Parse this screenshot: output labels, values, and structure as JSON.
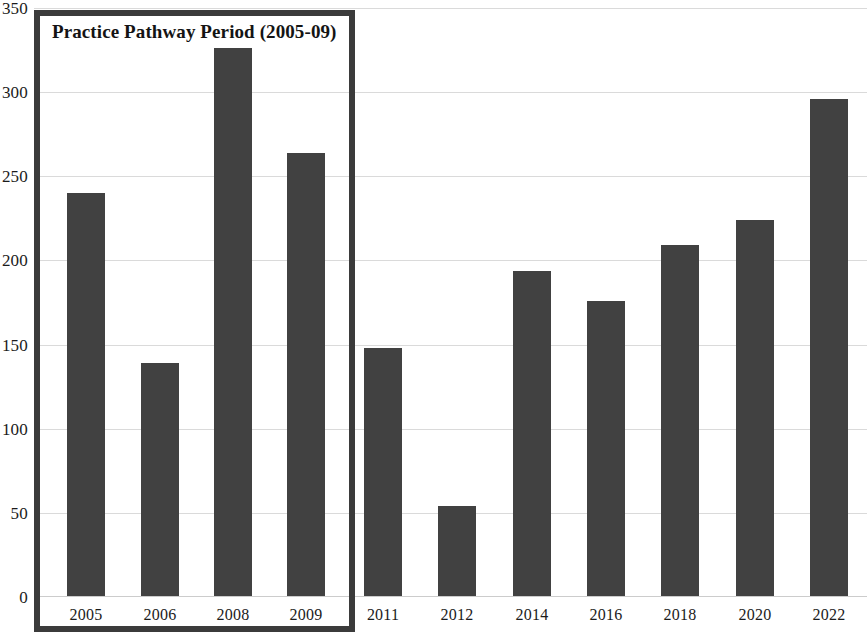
{
  "chart_data": {
    "type": "bar",
    "title": "",
    "xlabel": "",
    "ylabel": "",
    "ylim": [
      0,
      350
    ],
    "ytick_step": 50,
    "yticks": [
      350,
      300,
      250,
      200,
      150,
      100,
      50,
      0
    ],
    "grid": true,
    "legend": "none",
    "categories": [
      "2005",
      "2006",
      "2008",
      "2009",
      "2011",
      "2012",
      "2014",
      "2016",
      "2018",
      "2020",
      "2022"
    ],
    "values": [
      240,
      139,
      326,
      264,
      148,
      54,
      194,
      176,
      209,
      224,
      296
    ],
    "series": [
      {
        "name": "Count",
        "values": [
          240,
          139,
          326,
          264,
          148,
          54,
          194,
          176,
          209,
          224,
          296
        ]
      }
    ],
    "annotations": [
      {
        "type": "highlight-box",
        "label": "Practice Pathway Period (2005-09)",
        "covers": [
          "2005",
          "2006",
          "2008",
          "2009"
        ]
      }
    ],
    "colors": {
      "bar": "#414141",
      "gridline": "#dadada",
      "annotation_border": "#3b3b3b",
      "text": "#1b1b1b",
      "background": "#ffffff"
    }
  },
  "annotation": {
    "label": "Practice Pathway Period (2005-09)"
  },
  "axis": {
    "y": {
      "ticks": [
        {
          "label": "350",
          "value": 350
        },
        {
          "label": "300",
          "value": 300
        },
        {
          "label": "250",
          "value": 250
        },
        {
          "label": "200",
          "value": 200
        },
        {
          "label": "150",
          "value": 150
        },
        {
          "label": "100",
          "value": 100
        },
        {
          "label": "50",
          "value": 50
        },
        {
          "label": "0",
          "value": 0
        }
      ]
    },
    "x": {
      "ticks": [
        {
          "label": "2005"
        },
        {
          "label": "2006"
        },
        {
          "label": "2008"
        },
        {
          "label": "2009"
        },
        {
          "label": "2011"
        },
        {
          "label": "2012"
        },
        {
          "label": "2014"
        },
        {
          "label": "2016"
        },
        {
          "label": "2018"
        },
        {
          "label": "2020"
        },
        {
          "label": "2022"
        }
      ]
    }
  }
}
